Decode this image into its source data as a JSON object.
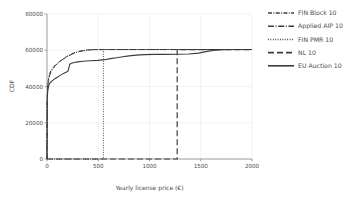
{
  "figure": {
    "title": "",
    "background": "#ffffff",
    "line_color": "#3c3c3c",
    "grid_color": "#e9e9e9"
  },
  "axes": {
    "xlabel": "Yearly license price (€)",
    "ylabel": "CDF",
    "xticks": [
      "0",
      "500",
      "1000",
      "1500",
      "2000"
    ],
    "yticks": [
      "0",
      "20000",
      "40000",
      "60000",
      "80000"
    ]
  },
  "legend": {
    "position": "right",
    "items": [
      {
        "label": "FIN Block 10",
        "style": "dashdot"
      },
      {
        "label": "Applied AIP 10",
        "style": "dashdot-long"
      },
      {
        "label": "FIN PMR 10",
        "style": "dotted"
      },
      {
        "label": "NL 10",
        "style": "dashed"
      },
      {
        "label": "EU Auction 10",
        "style": "solid"
      }
    ]
  },
  "chart_data": {
    "type": "line",
    "title": "",
    "xlabel": "Yearly license price (€)",
    "ylabel": "CDF",
    "xlim": [
      0,
      2000
    ],
    "ylim": [
      0,
      80000
    ],
    "xticks": [
      0,
      500,
      1000,
      1500,
      2000
    ],
    "yticks": [
      0,
      20000,
      40000,
      60000,
      80000
    ],
    "grid": true,
    "legend_position": "right",
    "series": [
      {
        "name": "FIN Block 10",
        "style": "dashdot",
        "points": [
          [
            0,
            0
          ],
          [
            2,
            33000
          ],
          [
            8,
            41000
          ],
          [
            15,
            44500
          ],
          [
            25,
            47000
          ],
          [
            40,
            49000
          ],
          [
            60,
            50500
          ],
          [
            85,
            52000
          ],
          [
            115,
            53500
          ],
          [
            150,
            55000
          ],
          [
            190,
            56500
          ],
          [
            230,
            57800
          ],
          [
            275,
            58800
          ],
          [
            320,
            59500
          ],
          [
            370,
            60000
          ],
          [
            420,
            60300
          ],
          [
            500,
            60400
          ],
          [
            600,
            60400
          ],
          [
            800,
            60400
          ],
          [
            1000,
            60400
          ],
          [
            1300,
            60400
          ],
          [
            1600,
            60400
          ],
          [
            2000,
            60400
          ]
        ]
      },
      {
        "name": "Applied AIP 10",
        "style": "dashdot-long",
        "points": [
          [
            0,
            0
          ],
          [
            2,
            32500
          ],
          [
            10,
            41500
          ],
          [
            20,
            45000
          ],
          [
            35,
            47500
          ],
          [
            55,
            49500
          ],
          [
            80,
            51500
          ],
          [
            110,
            53000
          ],
          [
            150,
            54800
          ],
          [
            200,
            56500
          ],
          [
            250,
            58000
          ],
          [
            310,
            59200
          ],
          [
            380,
            60000
          ],
          [
            450,
            60300
          ],
          [
            600,
            60400
          ],
          [
            900,
            60400
          ],
          [
            1300,
            60400
          ],
          [
            1700,
            60400
          ],
          [
            2000,
            60400
          ]
        ]
      },
      {
        "name": "FIN PMR 10",
        "style": "dotted",
        "vertical_line_x": 550,
        "points": [
          [
            0,
            0
          ],
          [
            550,
            0
          ],
          [
            550,
            60400
          ],
          [
            2000,
            60400
          ]
        ]
      },
      {
        "name": "NL 10",
        "style": "dashed",
        "vertical_line_x": 1270,
        "points": [
          [
            0,
            0
          ],
          [
            1270,
            0
          ],
          [
            1270,
            60400
          ],
          [
            2000,
            60400
          ]
        ]
      },
      {
        "name": "EU Auction 10",
        "style": "solid",
        "points": [
          [
            0,
            0
          ],
          [
            2,
            31500
          ],
          [
            6,
            37000
          ],
          [
            12,
            39500
          ],
          [
            20,
            41000
          ],
          [
            32,
            42200
          ],
          [
            48,
            43000
          ],
          [
            65,
            43800
          ],
          [
            85,
            44500
          ],
          [
            105,
            45200
          ],
          [
            125,
            46000
          ],
          [
            145,
            46700
          ],
          [
            165,
            47300
          ],
          [
            185,
            47800
          ],
          [
            205,
            48500
          ],
          [
            222,
            52300
          ],
          [
            240,
            52800
          ],
          [
            265,
            53200
          ],
          [
            300,
            53600
          ],
          [
            350,
            53900
          ],
          [
            420,
            54200
          ],
          [
            500,
            54400
          ],
          [
            560,
            54800
          ],
          [
            620,
            55400
          ],
          [
            680,
            55900
          ],
          [
            740,
            56400
          ],
          [
            800,
            56900
          ],
          [
            870,
            57300
          ],
          [
            950,
            57600
          ],
          [
            1050,
            57700
          ],
          [
            1150,
            57750
          ],
          [
            1270,
            57800
          ],
          [
            1380,
            57900
          ],
          [
            1480,
            58400
          ],
          [
            1560,
            59400
          ],
          [
            1620,
            59900
          ],
          [
            1700,
            60300
          ],
          [
            1800,
            60400
          ],
          [
            2000,
            60400
          ]
        ]
      }
    ]
  }
}
